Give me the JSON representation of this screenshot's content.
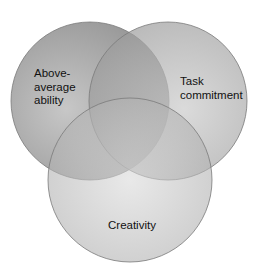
{
  "diagram": {
    "type": "venn",
    "sets": [
      {
        "id": "ability",
        "lines": [
          "Above-",
          "average",
          "ability"
        ],
        "cx": 90,
        "cy": 100,
        "r": 79
      },
      {
        "id": "task",
        "lines": [
          "Task",
          "commitment"
        ],
        "cx": 168,
        "cy": 100,
        "r": 79
      },
      {
        "id": "creativity",
        "lines": [
          "Creativity"
        ],
        "cx": 130,
        "cy": 180,
        "r": 82
      }
    ],
    "colors": {
      "background": "#ffffff",
      "ability_fill": "#a9a9a9",
      "task_fill": "#b2b2b2",
      "creativity_fill": "#c6c6c6",
      "outline": "#6f6f6f"
    }
  }
}
